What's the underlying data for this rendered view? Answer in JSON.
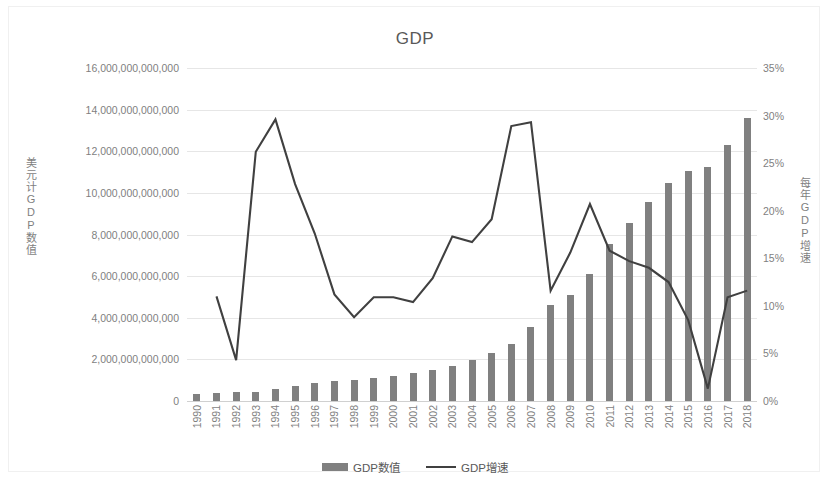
{
  "chart": {
    "title": "GDP",
    "left_axis_title": "美元计GDP数值",
    "right_axis_title": "每年GDP增速",
    "left_ticks": [
      "0",
      "2,000,000,000,000",
      "4,000,000,000,000",
      "6,000,000,000,000",
      "8,000,000,000,000",
      "10,000,000,000,000",
      "12,000,000,000,000",
      "14,000,000,000,000",
      "16,000,000,000,000"
    ],
    "right_ticks": [
      "0%",
      "5%",
      "10%",
      "15%",
      "20%",
      "25%",
      "30%",
      "35%"
    ],
    "legend": [
      {
        "label": "GDP数值",
        "type": "bar",
        "color": "#808080"
      },
      {
        "label": "GDP增速",
        "type": "line",
        "color": "#404040"
      }
    ]
  },
  "chart_data": {
    "type": "bar",
    "title": "GDP",
    "xlabel": "",
    "ylabel": "美元计GDP数值",
    "y2label": "每年GDP增速",
    "ylim": [
      0,
      16000000000000
    ],
    "y2lim": [
      0,
      0.35
    ],
    "grid": true,
    "legend_position": "bottom",
    "categories": [
      "1990",
      "1991",
      "1992",
      "1993",
      "1994",
      "1995",
      "1996",
      "1997",
      "1998",
      "1999",
      "2000",
      "2001",
      "2002",
      "2003",
      "2004",
      "2005",
      "2006",
      "2007",
      "2008",
      "2009",
      "2010",
      "2011",
      "2012",
      "2013",
      "2014",
      "2015",
      "2016",
      "2017",
      "2018"
    ],
    "series": [
      {
        "name": "GDP数值",
        "type": "bar",
        "axis": "left",
        "unit": "USD",
        "values": [
          360000000000,
          383000000000,
          427000000000,
          444000000000,
          564000000000,
          734000000000,
          863000000000,
          962000000000,
          1030000000000,
          1094000000000,
          1211000000000,
          1339000000000,
          1471000000000,
          1660000000000,
          1955000000000,
          2286000000000,
          2752000000000,
          3552000000000,
          4598000000000,
          5110000000000,
          6087000000000,
          7552000000000,
          8532000000000,
          9570000000000,
          10475000000000,
          11062000000000,
          11233000000000,
          12310000000000,
          13608000000000
        ]
      },
      {
        "name": "GDP增速",
        "type": "line",
        "axis": "right",
        "unit": "percent",
        "values": [
          0.06,
          0.11,
          0.043,
          0.262,
          0.296,
          0.228,
          0.176,
          0.112,
          0.088,
          0.109,
          0.109,
          0.104,
          0.129,
          0.173,
          0.167,
          0.191,
          0.289,
          0.293,
          0.116,
          0.156,
          0.207,
          0.158,
          0.147,
          0.14,
          0.125,
          0.085,
          0.013,
          0.109,
          0.116
        ]
      }
    ],
    "note": "Line series is plotted on the right percentage axis; 1990 is the first bar and the line begins at 1991."
  }
}
